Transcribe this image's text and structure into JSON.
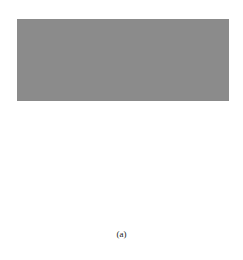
{
  "figure": {
    "caption": "(a)",
    "labels": {
      "left": {
        "base": "P",
        "sub": "l"
      },
      "center": {
        "base": "P",
        "sub": ""
      },
      "right": {
        "base": "P",
        "sub": "r"
      }
    },
    "colors": {
      "background": "#8a8a8a",
      "bbox_dotted": "#f2f2f2",
      "bottom_box": "#ffffff",
      "lines": "#111111"
    }
  }
}
